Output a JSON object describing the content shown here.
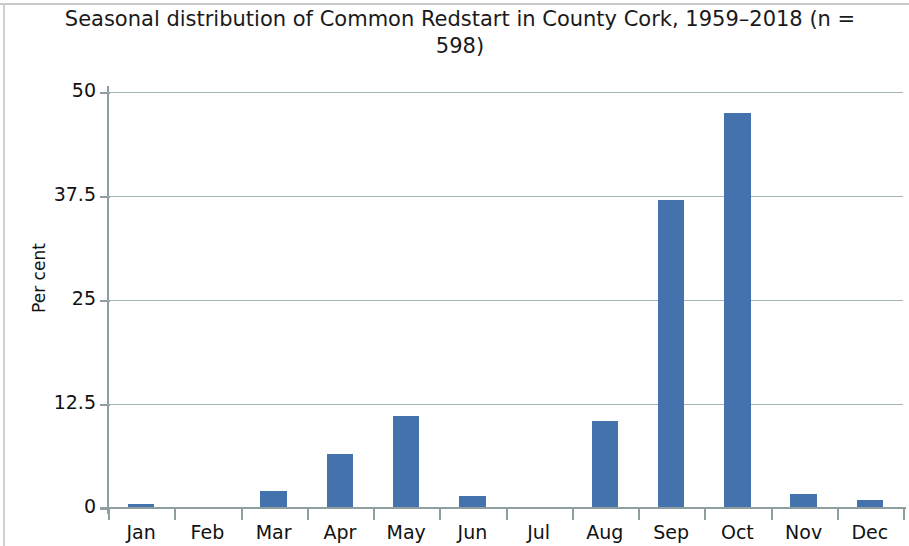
{
  "figure": {
    "title_line1": "Seasonal distribution of Common Redstart in County Cork,",
    "title_line2": "1959–2018 (n = 598)",
    "title_full": "Seasonal distribution of Common Redstart in County Cork,\n1959–2018 (n = 598)",
    "bar_color": "#4472ad",
    "grid_color": "#a6b3b3",
    "axis_color": "#8f9e9e",
    "text_color": "#111111"
  },
  "chart_data": {
    "type": "bar",
    "title": "Seasonal distribution of Common Redstart in County Cork, 1959–2018 (n = 598)",
    "xlabel": "",
    "ylabel": "Per cent",
    "categories": [
      "Jan",
      "Feb",
      "Mar",
      "Apr",
      "May",
      "Jun",
      "Jul",
      "Aug",
      "Sep",
      "Oct",
      "Nov",
      "Dec"
    ],
    "values": [
      0.5,
      0.0,
      2.0,
      6.5,
      11.0,
      1.5,
      0.0,
      10.5,
      37.0,
      47.5,
      1.7,
      1.0
    ],
    "ylim": [
      0,
      50
    ],
    "yticks": [
      0,
      12.5,
      25,
      37.5,
      50
    ],
    "ytick_labels": [
      "0",
      "12.5",
      "25",
      "37.5",
      "50"
    ],
    "grid": "horizontal",
    "legend": "none",
    "n": 598,
    "period": "1959–2018",
    "series_name": "Per cent of records"
  }
}
